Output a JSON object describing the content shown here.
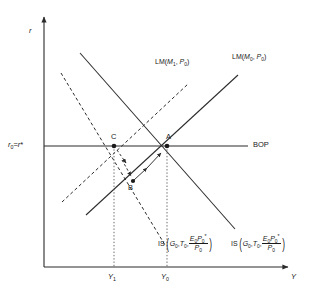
{
  "figure": {
    "type": "is-lm-bp-diagram",
    "axes": {
      "y_axis_label": "r",
      "x_axis_label": "Y"
    },
    "axis_ticks": {
      "y": [
        {
          "id": "r0",
          "label_parts": {
            "base": "r",
            "sub": "0",
            "eq": "=",
            "base2": "r",
            "star": "*"
          },
          "plain": "r0 = r*"
        }
      ],
      "x": [
        {
          "id": "Y1",
          "base": "Y",
          "sub": "1",
          "plain": "Y1"
        },
        {
          "id": "Y0",
          "base": "Y",
          "sub": "0",
          "plain": "Y0"
        }
      ]
    },
    "curves": [
      {
        "id": "lm-m0",
        "style": "solid",
        "label": {
          "prefix": "LM",
          "arg1_base": "M",
          "arg1_sub": "0",
          "arg2_base": "P",
          "arg2_sub": "0",
          "plain": "LM(M0, P0)"
        }
      },
      {
        "id": "lm-m1",
        "style": "dashed",
        "label": {
          "prefix": "LM",
          "arg1_base": "M",
          "arg1_sub": "1",
          "arg2_base": "P",
          "arg2_sub": "0",
          "plain": "LM(M1, P0)"
        }
      },
      {
        "id": "is-solid",
        "style": "solid",
        "label": {
          "prefix": "IS",
          "arg1_base": "G",
          "arg1_sub": "0",
          "arg2_base": "T",
          "arg2_sub": "0",
          "num_e": "E",
          "num_e_sub": "0",
          "num_p": "P",
          "num_p_sub": "0",
          "num_star": "*",
          "den_p": "P",
          "den_p_sub": "0",
          "plain": "IS(G0, T0, E0P0*/P0)"
        }
      },
      {
        "id": "is-dashed",
        "style": "dashed",
        "label": {
          "prefix": "IS",
          "arg1_base": "G",
          "arg1_sub": "0",
          "arg2_base": "T",
          "arg2_sub": "0",
          "num_e": "E",
          "num_e_sub": "0",
          "num_p": "P",
          "num_p_sub": "0",
          "num_star": "*",
          "den_p": "P",
          "den_p_sub": "0",
          "plain": "IS(G0, T0, E0P0*/P0)"
        }
      },
      {
        "id": "bop",
        "style": "solid-horizontal",
        "label": {
          "text": "BOP"
        }
      }
    ],
    "points": [
      {
        "id": "A",
        "label": "A"
      },
      {
        "id": "B",
        "label": "B"
      },
      {
        "id": "C",
        "label": "C"
      }
    ],
    "colors": {
      "line": "#2b2b2b",
      "text": "#1a1a1a",
      "guide": "#6e6e6e",
      "background": "#ffffff"
    }
  }
}
